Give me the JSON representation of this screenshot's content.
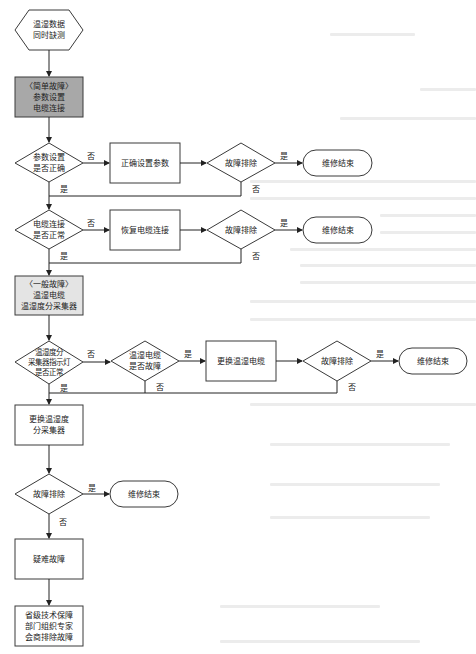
{
  "colors": {
    "stroke": "#3a3a3a",
    "fill_default": "#ffffff",
    "fill_simple_fault": "#a8a8a8",
    "fill_general_fault": "#e4e4e4",
    "bleed_text": "#ececec"
  },
  "labels": {
    "yes": "是",
    "no": "否"
  },
  "nodes": {
    "start": {
      "shape": "hexagon",
      "lines": [
        "温湿数据",
        "同时缺测"
      ]
    },
    "simple_fault": {
      "shape": "rect",
      "lines": [
        "〈简单故障〉",
        "参数设置",
        "电缆连接"
      ]
    },
    "param_check": {
      "shape": "diamond",
      "lines": [
        "参数设置",
        "是否正确"
      ]
    },
    "set_params": {
      "shape": "rect",
      "lines": [
        "正确设置参数"
      ]
    },
    "fixed_1": {
      "shape": "diamond",
      "lines": [
        "故障排除"
      ]
    },
    "end_1": {
      "shape": "terminal",
      "lines": [
        "维修结束"
      ]
    },
    "cable_check": {
      "shape": "diamond",
      "lines": [
        "电缆连接",
        "是否正常"
      ]
    },
    "restore_cable": {
      "shape": "rect",
      "lines": [
        "恢复电缆连接"
      ]
    },
    "fixed_2": {
      "shape": "diamond",
      "lines": [
        "故障排除"
      ]
    },
    "end_2": {
      "shape": "terminal",
      "lines": [
        "维修结束"
      ]
    },
    "general_fault": {
      "shape": "rect",
      "lines": [
        "〈一般故障〉",
        "温湿电缆",
        "温湿度分采集器"
      ]
    },
    "collector_check": {
      "shape": "diamond",
      "lines": [
        "温湿度分",
        "采集器指示灯",
        "是否正常"
      ]
    },
    "cable_fault_check": {
      "shape": "diamond",
      "lines": [
        "温湿电缆",
        "是否故障"
      ]
    },
    "replace_cable": {
      "shape": "rect",
      "lines": [
        "更换温湿电缆"
      ]
    },
    "fixed_3": {
      "shape": "diamond",
      "lines": [
        "故障排除"
      ]
    },
    "end_3": {
      "shape": "terminal",
      "lines": [
        "维修结束"
      ]
    },
    "replace_collector": {
      "shape": "rect",
      "lines": [
        "更换温湿度",
        "分采集器"
      ]
    },
    "fixed_4": {
      "shape": "diamond",
      "lines": [
        "故障排除"
      ]
    },
    "end_4": {
      "shape": "terminal",
      "lines": [
        "维修结束"
      ]
    },
    "difficult_fault": {
      "shape": "rect",
      "lines": [
        "疑难故障"
      ]
    },
    "expert_consult": {
      "shape": "rect",
      "lines": [
        "省级技术保障",
        "部门组织专家",
        "会商排除故障"
      ]
    }
  },
  "edges": [
    {
      "from": "start",
      "to": "simple_fault",
      "label": ""
    },
    {
      "from": "simple_fault",
      "to": "param_check",
      "label": ""
    },
    {
      "from": "param_check",
      "to": "set_params",
      "label": "否"
    },
    {
      "from": "set_params",
      "to": "fixed_1",
      "label": ""
    },
    {
      "from": "fixed_1",
      "to": "end_1",
      "label": "是"
    },
    {
      "from": "fixed_1",
      "to": "cable_check",
      "label": "否"
    },
    {
      "from": "param_check",
      "to": "cable_check",
      "label": "是"
    },
    {
      "from": "cable_check",
      "to": "restore_cable",
      "label": "否"
    },
    {
      "from": "restore_cable",
      "to": "fixed_2",
      "label": ""
    },
    {
      "from": "fixed_2",
      "to": "end_2",
      "label": "是"
    },
    {
      "from": "fixed_2",
      "to": "general_fault",
      "label": "否"
    },
    {
      "from": "cable_check",
      "to": "general_fault",
      "label": "是"
    },
    {
      "from": "general_fault",
      "to": "collector_check",
      "label": ""
    },
    {
      "from": "collector_check",
      "to": "cable_fault_check",
      "label": "否"
    },
    {
      "from": "cable_fault_check",
      "to": "replace_cable",
      "label": "是"
    },
    {
      "from": "cable_fault_check",
      "to": "replace_collector",
      "label": "否"
    },
    {
      "from": "replace_cable",
      "to": "fixed_3",
      "label": ""
    },
    {
      "from": "fixed_3",
      "to": "end_3",
      "label": "是"
    },
    {
      "from": "fixed_3",
      "to": "replace_collector",
      "label": "否"
    },
    {
      "from": "collector_check",
      "to": "replace_collector",
      "label": "是"
    },
    {
      "from": "replace_collector",
      "to": "fixed_4",
      "label": ""
    },
    {
      "from": "fixed_4",
      "to": "end_4",
      "label": "是"
    },
    {
      "from": "fixed_4",
      "to": "difficult_fault",
      "label": "否"
    },
    {
      "from": "difficult_fault",
      "to": "expert_consult",
      "label": ""
    }
  ]
}
